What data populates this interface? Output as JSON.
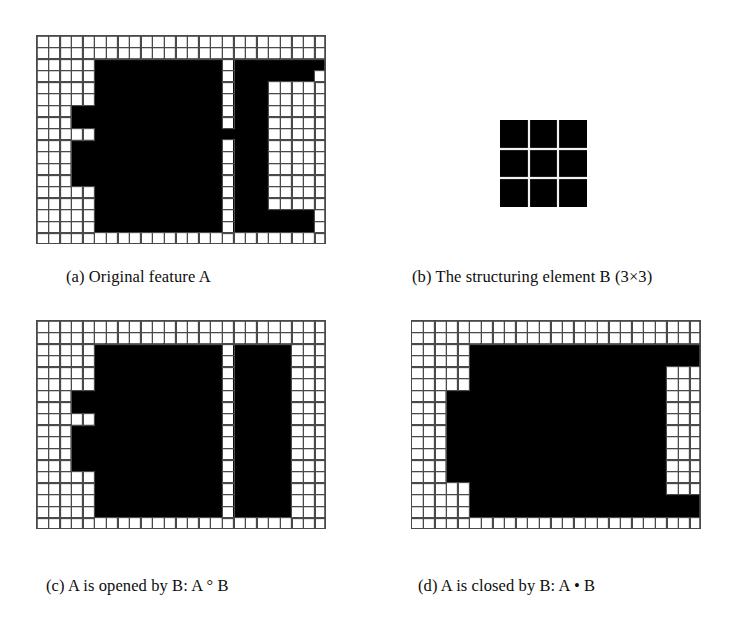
{
  "figure": {
    "background_color": "#ffffff",
    "foreground_color": "#000000",
    "grid_line_color": "#4a4a4a",
    "cell_size_px": 11.6,
    "grid_cols": 25,
    "grid_rows": 18
  },
  "panels": {
    "a": {
      "label": "a",
      "caption": "(a) Original feature A",
      "kind": "binary-grid",
      "cols": 25,
      "rows": 18,
      "rects": [
        {
          "x": 17,
          "y": 1,
          "w": 7,
          "h": 1
        },
        {
          "x": 17,
          "y": 2,
          "w": 7,
          "h": 1
        },
        {
          "x": 4,
          "y": 1,
          "w": 0,
          "h": 0
        },
        {
          "x": 16,
          "y": 1,
          "w": 0,
          "h": 0
        },
        {
          "x": 6,
          "y": 2,
          "w": 9,
          "h": 4
        },
        {
          "x": 17,
          "y": 3,
          "w": 6,
          "h": 1
        },
        {
          "x": 3,
          "y": 6,
          "w": 12,
          "h": 2
        },
        {
          "x": 5,
          "y": 8,
          "w": 10,
          "h": 1
        },
        {
          "x": 3,
          "y": 9,
          "w": 12,
          "h": 4
        },
        {
          "x": 5,
          "y": 13,
          "w": 10,
          "h": 3
        },
        {
          "x": 13,
          "y": 8,
          "w": 4,
          "h": 2
        },
        {
          "x": 17,
          "y": 4,
          "w": 3,
          "h": 11
        },
        {
          "x": 17,
          "y": 15,
          "w": 7,
          "h": 1
        },
        {
          "x": 20,
          "y": 14,
          "w": 4,
          "h": 2
        }
      ]
    },
    "b": {
      "label": "b",
      "caption": "(b) The structuring element B (3×3)",
      "kind": "structuring-element",
      "cols": 3,
      "rows": 3,
      "cell_px": 29
    },
    "c": {
      "label": "c",
      "caption": "(c) A is opened by B: A ° B",
      "kind": "binary-grid",
      "cols": 25,
      "rows": 18
    },
    "d": {
      "label": "d",
      "caption": "(d) A is closed by B: A • B",
      "kind": "binary-grid",
      "cols": 25,
      "rows": 18
    }
  },
  "masks": {
    "a": [
      "0000000000000000000000000",
      "0000000000000000000000000",
      "0000011111111111011111111",
      "0000011111111111011111110",
      "0000011111111111011100000",
      "0000011111111111011100000",
      "0001111111111111011100000",
      "0001111111111111011100000",
      "0000011111111111111100000",
      "0001111111111111011100000",
      "0001111111111111011100000",
      "0001111111111111011100000",
      "0001111111111111011100000",
      "0000011111111111011100000",
      "0000011111111111011100000",
      "0000011111111111011111110",
      "0000011111111111011111110",
      "0000000000000000000000000"
    ],
    "c": [
      "0000000000000000000000000",
      "0000000000000000000000000",
      "0000011111111111011111000",
      "0000011111111111011111000",
      "0000011111111111011111000",
      "0000011111111111011111000",
      "0001111111111111011111000",
      "0001111111111111011111000",
      "0000011111111111011111000",
      "0001111111111111011111000",
      "0001111111111111011111000",
      "0001111111111111011111000",
      "0001111111111111011111000",
      "0000011111111111011111000",
      "0000011111111111011111000",
      "0000011111111111011111000",
      "0000011111111111011111000",
      "0000000000000000000000000"
    ],
    "d": [
      "0000000000000000000000000",
      "0000000000000000000000000",
      "0000011111111111111111111",
      "0000011111111111111111111",
      "0000011111111111111111000",
      "0000011111111111111111000",
      "0001111111111111111111000",
      "0001111111111111111111000",
      "0001111111111111111111000",
      "0001111111111111111111000",
      "0001111111111111111111000",
      "0001111111111111111111000",
      "0001111111111111111111000",
      "0001111111111111111111000",
      "0000011111111111111111000",
      "0000011111111111111111111",
      "0000011111111111111111111",
      "0000000000000000000000000"
    ]
  }
}
